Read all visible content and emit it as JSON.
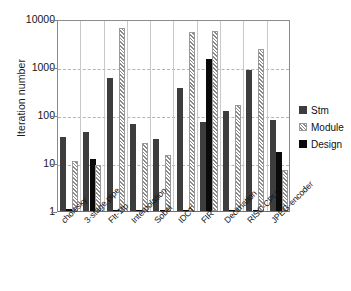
{
  "chart_data": {
    "type": "bar",
    "title": "",
    "xlabel": "",
    "ylabel": "Iteration number",
    "yscale": "log",
    "ylim": [
      1,
      10000
    ],
    "ytick_labels": [
      "10000",
      "1000",
      "100",
      "10",
      "1"
    ],
    "ytick_values": [
      10000,
      1000,
      100,
      10,
      1
    ],
    "grid": true,
    "legend_position": "right",
    "categories": [
      "cholesky",
      "3-stage pipe",
      "FIt-1fp",
      "Interpolation",
      "Sobel",
      "IDCT",
      "FIR",
      "Decimation",
      "RISC-CPU",
      "JPEG-encoder"
    ],
    "series": [
      {
        "name": "Stm",
        "color": "#3d3d3d",
        "values": [
          35,
          45,
          580,
          65,
          32,
          370,
          73,
          120,
          880,
          80
        ]
      },
      {
        "name": "Module",
        "color": "#f2f2f2",
        "values": [
          11,
          9,
          6500,
          26,
          15,
          5300,
          5700,
          160,
          2400,
          7
        ]
      },
      {
        "name": "Design",
        "color": "#0a0a0a",
        "values": [
          1.1,
          12,
          1.05,
          1.05,
          1.05,
          1.05,
          1500,
          1.05,
          1.05,
          17
        ]
      }
    ]
  },
  "legend": {
    "items": [
      {
        "label": "Stm",
        "swatch": "stm"
      },
      {
        "label": "Module",
        "swatch": "module"
      },
      {
        "label": "Design",
        "swatch": "design"
      }
    ]
  }
}
